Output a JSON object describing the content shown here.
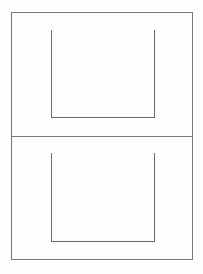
{
  "document": {
    "kind": "scanned-form-page",
    "page_width": 203,
    "page_height": 274,
    "background_color": "#fefefe",
    "line_color": "#787878",
    "line_color_dark": "#6a6a6a",
    "line_width": 1,
    "title_text": "",
    "visible_text": "",
    "outer_frame": {
      "x": 11,
      "y": 12,
      "width": 182,
      "height": 248
    },
    "divider": {
      "y": 136,
      "x_start": 11,
      "x_end": 193
    },
    "panels": [
      {
        "name": "top-panel",
        "frame": {
          "x": 11,
          "y": 12,
          "width": 182,
          "height": 124
        },
        "bracket": {
          "left_x": 51,
          "right_x": 155,
          "top_y": 29,
          "bottom_y": 118,
          "open_side": "top"
        }
      },
      {
        "name": "bottom-panel",
        "frame": {
          "x": 11,
          "y": 136,
          "width": 182,
          "height": 124
        },
        "bracket": {
          "left_x": 51,
          "right_x": 155,
          "top_y": 152,
          "bottom_y": 242,
          "open_side": "top"
        }
      }
    ]
  }
}
